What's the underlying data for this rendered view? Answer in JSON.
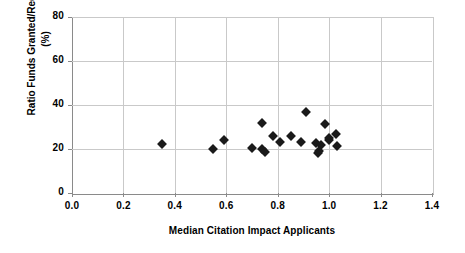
{
  "chart_data": {
    "type": "scatter",
    "title": "",
    "xlabel": "Median Citation Impact Applicants",
    "ylabel": "Ratio Funds Granted/Requested (%)",
    "ylabel_line1": "Ratio Funds Granted/Requested",
    "ylabel_line2": "(%)",
    "xlim": [
      0.0,
      1.4
    ],
    "ylim": [
      0,
      80
    ],
    "xticks": [
      "0.0",
      "0.2",
      "0.4",
      "0.6",
      "0.8",
      "1.0",
      "1.2",
      "1.4"
    ],
    "xtick_values": [
      0.0,
      0.2,
      0.4,
      0.6,
      0.8,
      1.0,
      1.2,
      1.4
    ],
    "yticks": [
      "0",
      "20",
      "40",
      "60",
      "80"
    ],
    "ytick_values": [
      0,
      20,
      40,
      60,
      80
    ],
    "grid": true,
    "legend": false,
    "marker": "filled-diamond",
    "marker_color": "#1a1a1a",
    "series": [
      {
        "name": "Research fields",
        "points": [
          {
            "x": 0.35,
            "y": 22.5
          },
          {
            "x": 0.55,
            "y": 20.0
          },
          {
            "x": 0.59,
            "y": 24.3
          },
          {
            "x": 0.7,
            "y": 20.5
          },
          {
            "x": 0.74,
            "y": 32.0
          },
          {
            "x": 0.74,
            "y": 19.8
          },
          {
            "x": 0.75,
            "y": 18.8
          },
          {
            "x": 0.78,
            "y": 25.8
          },
          {
            "x": 0.81,
            "y": 23.0
          },
          {
            "x": 0.85,
            "y": 26.0
          },
          {
            "x": 0.89,
            "y": 23.3
          },
          {
            "x": 0.91,
            "y": 36.8
          },
          {
            "x": 0.95,
            "y": 22.8
          },
          {
            "x": 0.955,
            "y": 18.3
          },
          {
            "x": 0.96,
            "y": 19.3
          },
          {
            "x": 0.97,
            "y": 22.0
          },
          {
            "x": 0.985,
            "y": 31.2
          },
          {
            "x": 1.0,
            "y": 24.0
          },
          {
            "x": 1.0,
            "y": 25.2
          },
          {
            "x": 1.025,
            "y": 27.0
          },
          {
            "x": 1.03,
            "y": 21.5
          }
        ]
      }
    ]
  }
}
